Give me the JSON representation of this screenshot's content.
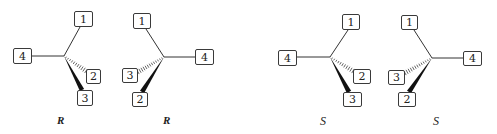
{
  "figure": {
    "molecules": [
      {
        "id": "mol-1",
        "configuration": "R",
        "center": [
          64,
          56
        ],
        "label_pos": [
          57,
          114
        ],
        "substituents": [
          {
            "priority": "1",
            "bond": "plain",
            "box": [
              74,
              11,
              19,
              16
            ],
            "end": [
              80,
              27
            ]
          },
          {
            "priority": "2",
            "bond": "hashed",
            "box": [
              86,
              69,
              15,
              15
            ],
            "end": [
              86,
              71
            ]
          },
          {
            "priority": "3",
            "bond": "wedge",
            "box": [
              77,
              90,
              16,
              16
            ],
            "end": [
              82,
              90
            ]
          },
          {
            "priority": "4",
            "bond": "plain",
            "box": [
              13,
              48,
              19,
              16
            ],
            "end": [
              32,
              56
            ]
          }
        ]
      },
      {
        "id": "mol-2",
        "configuration": "R",
        "center": [
          164,
          57
        ],
        "label_pos": [
          163,
          114
        ],
        "substituents": [
          {
            "priority": "1",
            "bond": "plain",
            "box": [
              133,
              13,
              18,
              16
            ],
            "end": [
              146,
              29
            ]
          },
          {
            "priority": "2",
            "bond": "wedge",
            "box": [
              132,
              92,
              16,
              15
            ],
            "end": [
              142,
              92
            ]
          },
          {
            "priority": "3",
            "bond": "hashed",
            "box": [
              122,
              68,
              16,
              15
            ],
            "end": [
              138,
              72
            ]
          },
          {
            "priority": "4",
            "bond": "plain",
            "box": [
              195,
              49,
              19,
              16
            ],
            "end": [
              195,
              57
            ]
          }
        ]
      },
      {
        "id": "mol-3",
        "configuration": "S",
        "center": [
          330,
          57
        ],
        "label_pos": [
          320,
          114
        ],
        "substituents": [
          {
            "priority": "1",
            "bond": "plain",
            "box": [
              342,
              14,
              18,
              16
            ],
            "end": [
              348,
              30
            ]
          },
          {
            "priority": "2",
            "bond": "hashed",
            "box": [
              353,
              69,
              18,
              15
            ],
            "end": [
              353,
              71
            ]
          },
          {
            "priority": "3",
            "bond": "wedge",
            "box": [
              343,
              92,
              19,
              15
            ],
            "end": [
              349,
              92
            ]
          },
          {
            "priority": "4",
            "bond": "plain",
            "box": [
              278,
              50,
              19,
              16
            ],
            "end": [
              297,
              57
            ]
          }
        ]
      },
      {
        "id": "mol-4",
        "configuration": "S",
        "center": [
          432,
          58
        ],
        "label_pos": [
          433,
          114
        ],
        "substituents": [
          {
            "priority": "1",
            "bond": "plain",
            "box": [
              401,
              15,
              17,
              15
            ],
            "end": [
              414,
              30
            ]
          },
          {
            "priority": "2",
            "bond": "wedge",
            "box": [
              398,
              92,
              18,
              15
            ],
            "end": [
              409,
              92
            ]
          },
          {
            "priority": "3",
            "bond": "hashed",
            "box": [
              388,
              70,
              17,
              15
            ],
            "end": [
              405,
              73
            ]
          },
          {
            "priority": "4",
            "bond": "plain",
            "box": [
              463,
              51,
              19,
              15
            ],
            "end": [
              463,
              58
            ]
          }
        ]
      }
    ]
  }
}
